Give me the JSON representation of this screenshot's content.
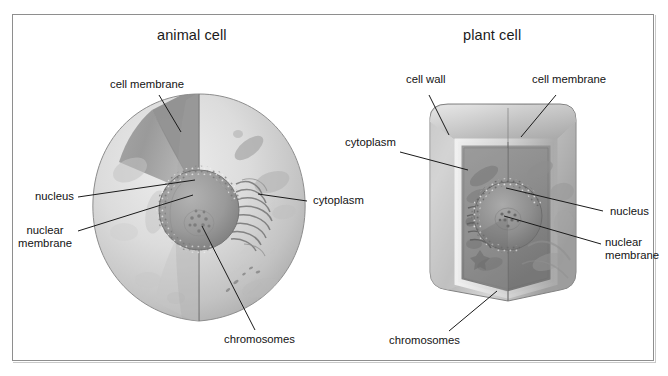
{
  "figure": {
    "kind": "biology-diagram",
    "background": "#ffffff",
    "frame_border_color": "#8e8e8e"
  },
  "panels": [
    {
      "id": "animal",
      "title": "animal cell",
      "labels": [
        {
          "key": "cell-membrane",
          "text": "cell membrane"
        },
        {
          "key": "nucleus",
          "text": "nucleus"
        },
        {
          "key": "nuclear-membrane",
          "line1": "nuclear",
          "line2": "membrane"
        },
        {
          "key": "cytoplasm",
          "text": "cytoplasm"
        },
        {
          "key": "chromosomes",
          "text": "chromosomes"
        }
      ]
    },
    {
      "id": "plant",
      "title": "plant cell",
      "labels": [
        {
          "key": "cell-wall",
          "text": "cell wall"
        },
        {
          "key": "cell-membrane",
          "text": "cell membrane"
        },
        {
          "key": "cytoplasm",
          "text": "cytoplasm"
        },
        {
          "key": "nucleus",
          "text": "nucleus"
        },
        {
          "key": "nuclear-membrane",
          "line1": "nuclear",
          "line2": "membrane"
        },
        {
          "key": "chromosomes",
          "text": "chromosomes"
        }
      ]
    }
  ],
  "animal": {
    "title": "animal cell",
    "cell_membrane": "cell membrane",
    "nucleus": "nucleus",
    "nuclear_membrane_l1": "nuclear",
    "nuclear_membrane_l2": "membrane",
    "cytoplasm": "cytoplasm",
    "chromosomes": "chromosomes"
  },
  "plant": {
    "title": "plant cell",
    "cell_wall": "cell wall",
    "cell_membrane": "cell membrane",
    "cytoplasm": "cytoplasm",
    "nucleus": "nucleus",
    "nuclear_membrane_l1": "nuclear",
    "nuclear_membrane_l2": "membrane",
    "chromosomes": "chromosomes"
  },
  "colors": {
    "text": "#131313",
    "leader_line": "#1a1a1a",
    "frame": "#8e8e8e",
    "cell_light": "#d9d9d9",
    "cell_mid": "#b4b4b4",
    "cell_dark": "#8a8a8a",
    "nucleus": "#9a9a9a"
  }
}
